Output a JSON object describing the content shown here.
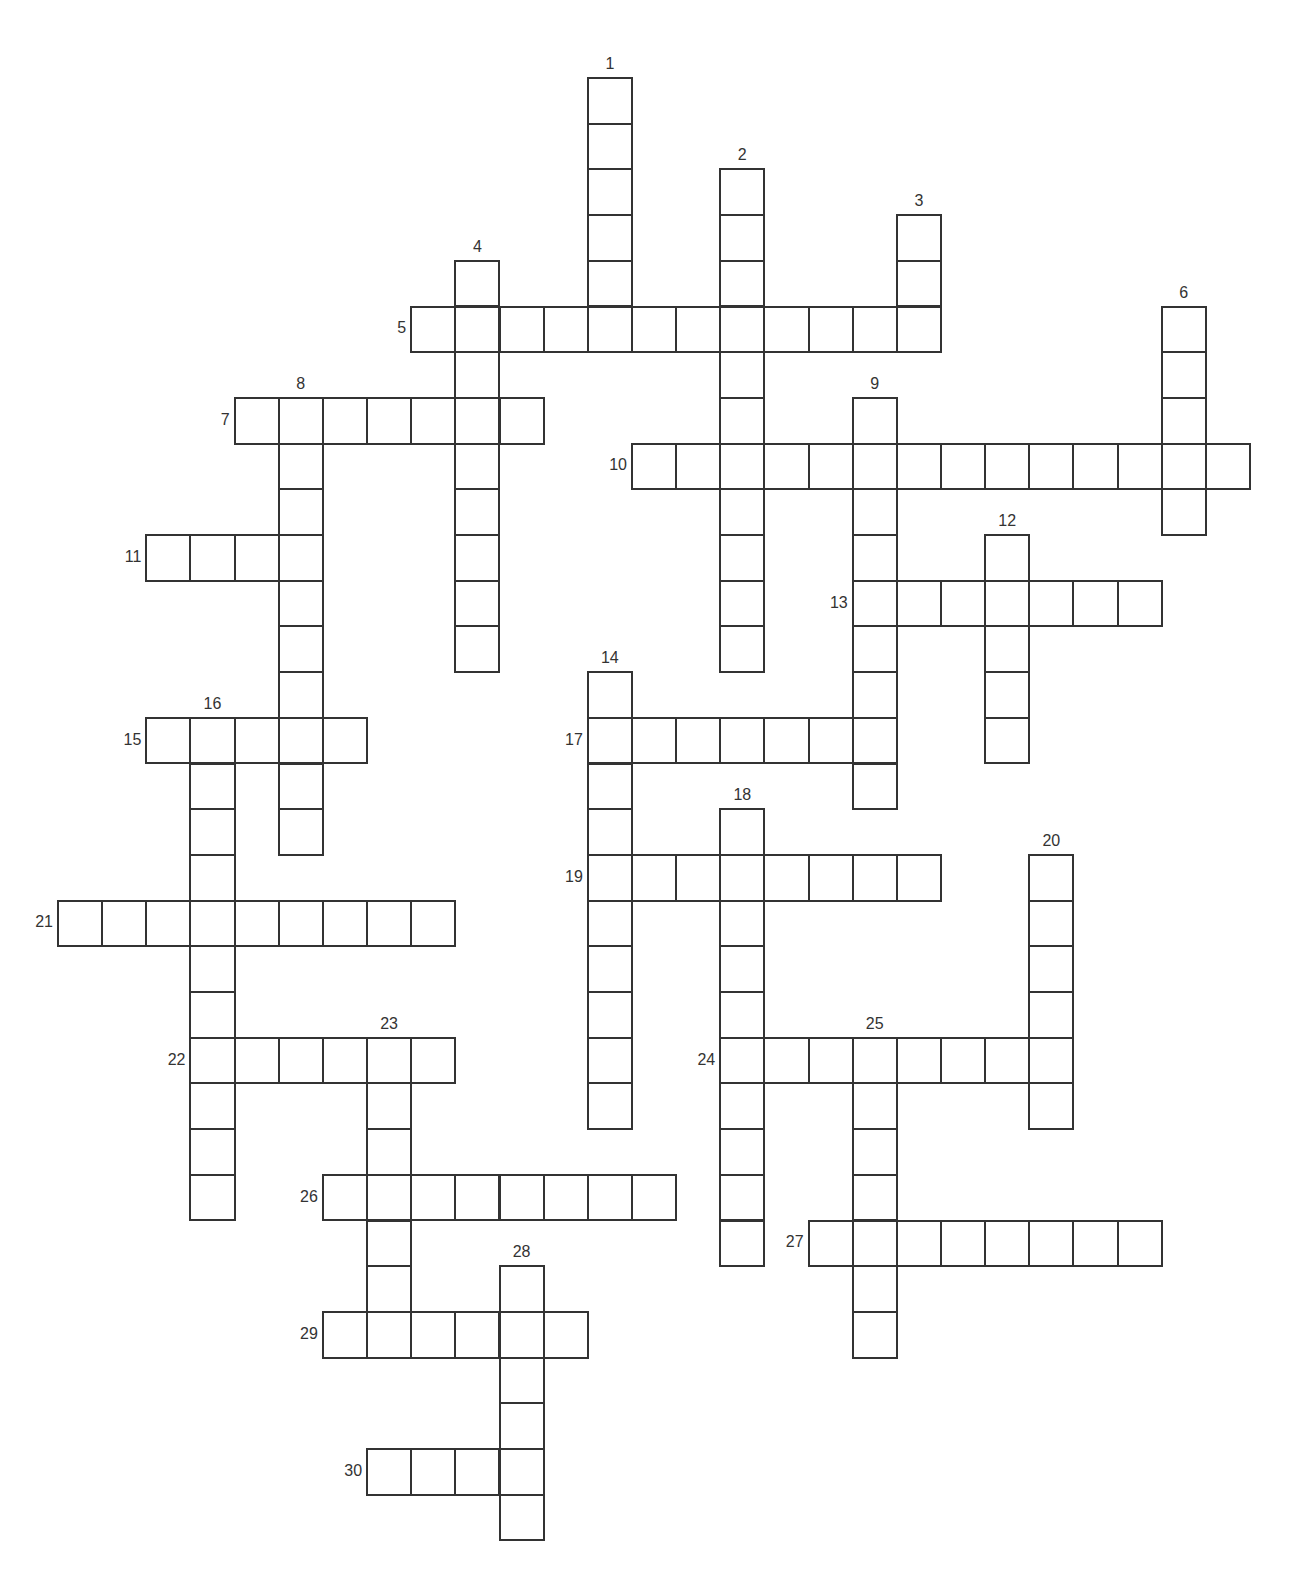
{
  "puzzle": {
    "type": "crossword",
    "grid_origin": {
      "x": 57,
      "y": 77
    },
    "cell_pitch": {
      "x": 44.15,
      "y": 45.7
    },
    "line_color": "#333333",
    "background": "#ffffff"
  },
  "entries": [
    {
      "number": "1",
      "direction": "down",
      "row": 0,
      "col": 12,
      "length": 6
    },
    {
      "number": "2",
      "direction": "down",
      "row": 2,
      "col": 15,
      "length": 11
    },
    {
      "number": "3",
      "direction": "down",
      "row": 3,
      "col": 19,
      "length": 3
    },
    {
      "number": "4",
      "direction": "down",
      "row": 4,
      "col": 9,
      "length": 9
    },
    {
      "number": "5",
      "direction": "across",
      "row": 5,
      "col": 8,
      "length": 12
    },
    {
      "number": "6",
      "direction": "down",
      "row": 5,
      "col": 25,
      "length": 5
    },
    {
      "number": "7",
      "direction": "across",
      "row": 7,
      "col": 4,
      "length": 7
    },
    {
      "number": "8",
      "direction": "down",
      "row": 7,
      "col": 5,
      "length": 10
    },
    {
      "number": "9",
      "direction": "down",
      "row": 7,
      "col": 18,
      "length": 9
    },
    {
      "number": "10",
      "direction": "across",
      "row": 8,
      "col": 13,
      "length": 14
    },
    {
      "number": "11",
      "direction": "across",
      "row": 10,
      "col": 2,
      "length": 4
    },
    {
      "number": "12",
      "direction": "down",
      "row": 10,
      "col": 21,
      "length": 5
    },
    {
      "number": "13",
      "direction": "across",
      "row": 11,
      "col": 18,
      "length": 7
    },
    {
      "number": "14",
      "direction": "down",
      "row": 13,
      "col": 12,
      "length": 10
    },
    {
      "number": "15",
      "direction": "across",
      "row": 14,
      "col": 2,
      "length": 5
    },
    {
      "number": "16",
      "direction": "down",
      "row": 14,
      "col": 3,
      "length": 11
    },
    {
      "number": "17",
      "direction": "across",
      "row": 14,
      "col": 12,
      "length": 7
    },
    {
      "number": "18",
      "direction": "down",
      "row": 16,
      "col": 15,
      "length": 10
    },
    {
      "number": "19",
      "direction": "across",
      "row": 17,
      "col": 12,
      "length": 8
    },
    {
      "number": "20",
      "direction": "down",
      "row": 17,
      "col": 22,
      "length": 6
    },
    {
      "number": "21",
      "direction": "across",
      "row": 18,
      "col": 0,
      "length": 9
    },
    {
      "number": "22",
      "direction": "across",
      "row": 21,
      "col": 3,
      "length": 6
    },
    {
      "number": "23",
      "direction": "down",
      "row": 21,
      "col": 7,
      "length": 7
    },
    {
      "number": "24",
      "direction": "across",
      "row": 21,
      "col": 15,
      "length": 8
    },
    {
      "number": "25",
      "direction": "down",
      "row": 21,
      "col": 18,
      "length": 7
    },
    {
      "number": "26",
      "direction": "across",
      "row": 24,
      "col": 6,
      "length": 8
    },
    {
      "number": "27",
      "direction": "across",
      "row": 25,
      "col": 17,
      "length": 8
    },
    {
      "number": "28",
      "direction": "down",
      "row": 26,
      "col": 10,
      "length": 6
    },
    {
      "number": "29",
      "direction": "across",
      "row": 27,
      "col": 6,
      "length": 6
    },
    {
      "number": "30",
      "direction": "across",
      "row": 30,
      "col": 7,
      "length": 4
    }
  ]
}
